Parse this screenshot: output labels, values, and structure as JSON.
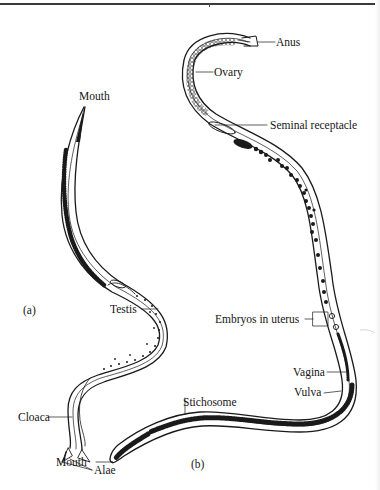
{
  "figure": {
    "panels": [
      {
        "id": "a",
        "label": "(a)"
      },
      {
        "id": "b",
        "label": "(b)"
      }
    ],
    "labels_a": {
      "mouth": "Mouth",
      "testis": "Testis",
      "cloaca": "Cloaca",
      "alae": "Alae"
    },
    "labels_b": {
      "anus": "Anus",
      "ovary": "Ovary",
      "seminal_receptacle": "Seminal receptacle",
      "embryos_in_uterus": "Embryos in uterus",
      "vagina": "Vagina",
      "vulva": "Vulva",
      "stichosome": "Stichosome",
      "mouth": "Mouth"
    },
    "colors": {
      "ink": "#1a1a1a",
      "background": "#ffffff"
    }
  }
}
